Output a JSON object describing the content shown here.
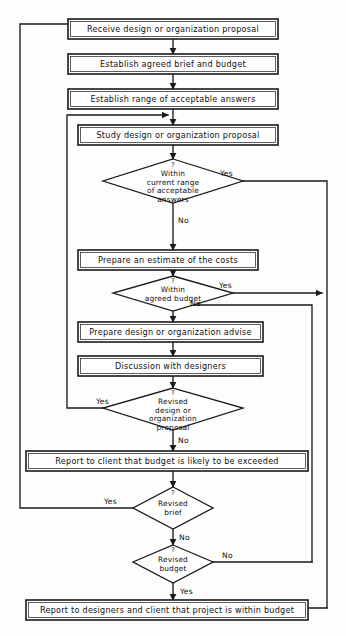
{
  "diagram": {
    "type": "flowchart",
    "colors": {
      "stroke": "#1a1a1a",
      "fill": "#ffffff",
      "background": "#fdfdfc"
    },
    "process_boxes": [
      {
        "id": "receive",
        "label": "Receive design or organization proposal"
      },
      {
        "id": "brief",
        "label": "Establish agreed brief and budget"
      },
      {
        "id": "range",
        "label": "Establish range of acceptable answers"
      },
      {
        "id": "study",
        "label": "Study design or organization proposal"
      },
      {
        "id": "estimate",
        "label": "Prepare an estimate of the costs"
      },
      {
        "id": "advise",
        "label": "Prepare design or organization advise"
      },
      {
        "id": "discussion",
        "label": "Discussion with designers"
      },
      {
        "id": "report_client",
        "label": "Report to client that budget is likely to be exceeded"
      },
      {
        "id": "report_final",
        "label": "Report to designers and client that project is within budget"
      }
    ],
    "decisions": [
      {
        "id": "within_range",
        "marker": "?",
        "lines": [
          "Within",
          "current range",
          "of acceptable",
          "answers"
        ],
        "yes_label": "Yes",
        "no_label": "No"
      },
      {
        "id": "within_budget",
        "marker": "?",
        "lines": [
          "Within",
          "agreed budget"
        ],
        "yes_label": "Yes",
        "no_label": "No"
      },
      {
        "id": "revised_proposal",
        "marker": "?",
        "lines": [
          "Revised",
          "design or",
          "organization",
          "proposal"
        ],
        "yes_label": "Yes",
        "no_label": "No"
      },
      {
        "id": "revised_brief",
        "marker": "?",
        "lines": [
          "Revised",
          "brief"
        ],
        "yes_label": "Yes",
        "no_label": "No"
      },
      {
        "id": "revised_budget",
        "marker": "?",
        "lines": [
          "Revised",
          "budget"
        ],
        "yes_label": "Yes",
        "no_label": "No"
      }
    ],
    "edge_labels": {
      "range_yes": "Yes",
      "range_no": "No",
      "budget_yes": "Yes",
      "budget_no": "No",
      "proposal_yes": "Yes",
      "proposal_no": "No",
      "brief_yes": "Yes",
      "brief_no": "No",
      "rbudget_no": "No",
      "rbudget_yes": "Yes"
    }
  }
}
